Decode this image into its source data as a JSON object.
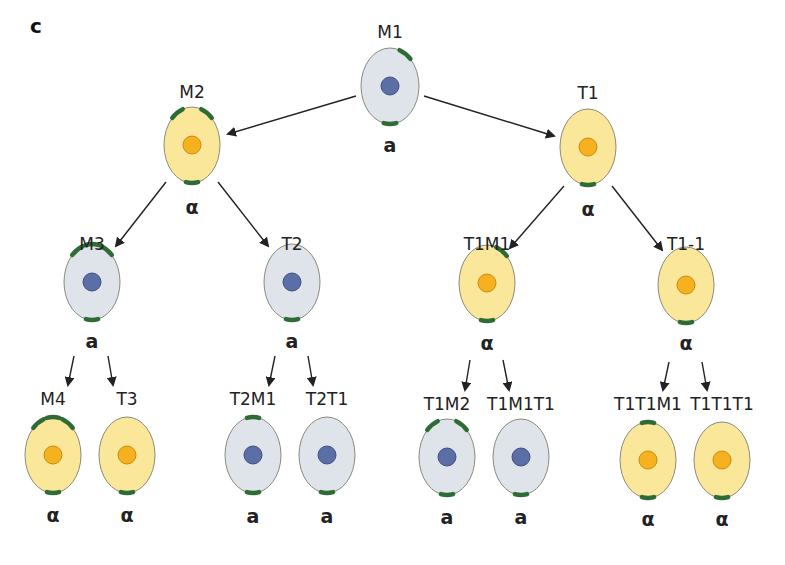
{
  "figure": {
    "panel_label": "c",
    "colors": {
      "a_cell_fill": "#dfe3ea",
      "a_nucleus": "#5b6ea6",
      "alpha_cell_fill": "#fbe79a",
      "alpha_nucleus": "#f6b21e",
      "cell_outline": "#8a8a7a",
      "polar_mark": "#2f6b34",
      "arrow": "#222222"
    },
    "cells": [
      {
        "id": "M1",
        "label": "M1",
        "fate": "a",
        "type": "a",
        "cx": 390,
        "cy": 86,
        "rx": 29,
        "ry": 38,
        "lx": 390,
        "ly": 38,
        "fy": 152,
        "marks": [
          "top-right",
          "bottom"
        ]
      },
      {
        "id": "M2",
        "label": "M2",
        "fate": "α",
        "type": "alpha",
        "cx": 192,
        "cy": 145,
        "rx": 28,
        "ry": 38,
        "lx": 192,
        "ly": 98,
        "fy": 214,
        "marks": [
          "top-left",
          "top-right",
          "bottom"
        ]
      },
      {
        "id": "T1",
        "label": "T1",
        "fate": "α",
        "type": "alpha",
        "cx": 588,
        "cy": 147,
        "rx": 28,
        "ry": 38,
        "lx": 588,
        "ly": 99,
        "fy": 216,
        "marks": [
          "bottom"
        ]
      },
      {
        "id": "M3",
        "label": "M3",
        "fate": "a",
        "type": "a",
        "cx": 92,
        "cy": 282,
        "rx": 28,
        "ry": 38,
        "lx": 92,
        "ly": 250,
        "fy": 348,
        "marks": [
          "top-left",
          "top",
          "top-right",
          "bottom"
        ]
      },
      {
        "id": "T2",
        "label": "T2",
        "fate": "a",
        "type": "a",
        "cx": 292,
        "cy": 282,
        "rx": 28,
        "ry": 38,
        "lx": 292,
        "ly": 250,
        "fy": 348,
        "marks": [
          "bottom"
        ]
      },
      {
        "id": "T1M1",
        "label": "T1M1",
        "fate": "α",
        "type": "alpha",
        "cx": 487,
        "cy": 283,
        "rx": 28,
        "ry": 38,
        "lx": 487,
        "ly": 250,
        "fy": 350,
        "marks": [
          "top-right",
          "bottom"
        ]
      },
      {
        "id": "T1-1",
        "label": "T1-1",
        "fate": "α",
        "type": "alpha",
        "cx": 686,
        "cy": 285,
        "rx": 28,
        "ry": 38,
        "lx": 686,
        "ly": 250,
        "fy": 350,
        "marks": [
          "bottom"
        ]
      },
      {
        "id": "M4",
        "label": "M4",
        "fate": "α",
        "type": "alpha",
        "cx": 53,
        "cy": 455,
        "rx": 28,
        "ry": 38,
        "lx": 53,
        "ly": 405,
        "fy": 522,
        "marks": [
          "top-left",
          "top",
          "top-right",
          "bottom"
        ]
      },
      {
        "id": "T3",
        "label": "T3",
        "fate": "α",
        "type": "alpha",
        "cx": 127,
        "cy": 455,
        "rx": 28,
        "ry": 38,
        "lx": 127,
        "ly": 405,
        "fy": 522,
        "marks": [
          "bottom"
        ]
      },
      {
        "id": "T2M1",
        "label": "T2M1",
        "fate": "a",
        "type": "a",
        "cx": 253,
        "cy": 455,
        "rx": 28,
        "ry": 38,
        "lx": 253,
        "ly": 405,
        "fy": 523,
        "marks": [
          "top",
          "bottom"
        ]
      },
      {
        "id": "T2T1",
        "label": "T2T1",
        "fate": "a",
        "type": "a",
        "cx": 327,
        "cy": 455,
        "rx": 28,
        "ry": 38,
        "lx": 327,
        "ly": 405,
        "fy": 523,
        "marks": [
          "bottom"
        ]
      },
      {
        "id": "T1M2",
        "label": "T1M2",
        "fate": "a",
        "type": "a",
        "cx": 447,
        "cy": 457,
        "rx": 28,
        "ry": 38,
        "lx": 447,
        "ly": 410,
        "fy": 524,
        "marks": [
          "top-left",
          "top-right",
          "bottom"
        ]
      },
      {
        "id": "T1M1T1",
        "label": "T1M1T1",
        "fate": "a",
        "type": "a",
        "cx": 521,
        "cy": 457,
        "rx": 28,
        "ry": 38,
        "lx": 521,
        "ly": 410,
        "fy": 524,
        "marks": [
          "bottom"
        ]
      },
      {
        "id": "T1T1M1",
        "label": "T1T1M1",
        "fate": "α",
        "type": "alpha",
        "cx": 648,
        "cy": 460,
        "rx": 28,
        "ry": 38,
        "lx": 648,
        "ly": 410,
        "fy": 526,
        "marks": [
          "top",
          "bottom"
        ]
      },
      {
        "id": "T1T1T1",
        "label": "T1T1T1",
        "fate": "α",
        "type": "alpha",
        "cx": 722,
        "cy": 460,
        "rx": 28,
        "ry": 38,
        "lx": 722,
        "ly": 410,
        "fy": 526,
        "marks": [
          "bottom"
        ]
      }
    ],
    "arrows": [
      {
        "from": "M1",
        "to": "M2",
        "x1": 356,
        "y1": 96,
        "x2": 228,
        "y2": 134
      },
      {
        "from": "M1",
        "to": "T1",
        "x1": 424,
        "y1": 96,
        "x2": 554,
        "y2": 136
      },
      {
        "from": "M2",
        "to": "M3",
        "x1": 166,
        "y1": 182,
        "x2": 116,
        "y2": 246
      },
      {
        "from": "M2",
        "to": "T2",
        "x1": 218,
        "y1": 182,
        "x2": 268,
        "y2": 246
      },
      {
        "from": "T1",
        "to": "T1M1",
        "x1": 564,
        "y1": 186,
        "x2": 510,
        "y2": 248
      },
      {
        "from": "T1",
        "to": "T1-1",
        "x1": 612,
        "y1": 186,
        "x2": 662,
        "y2": 250
      },
      {
        "from": "M3",
        "to": "M4",
        "x1": 74,
        "y1": 356,
        "x2": 68,
        "y2": 385
      },
      {
        "from": "M3",
        "to": "T3",
        "x1": 108,
        "y1": 356,
        "x2": 113,
        "y2": 385
      },
      {
        "from": "T2",
        "to": "T2M1",
        "x1": 275,
        "y1": 356,
        "x2": 269,
        "y2": 385
      },
      {
        "from": "T2",
        "to": "T2T1",
        "x1": 308,
        "y1": 356,
        "x2": 313,
        "y2": 385
      },
      {
        "from": "T1M1",
        "to": "T1M2",
        "x1": 470,
        "y1": 360,
        "x2": 465,
        "y2": 390
      },
      {
        "from": "T1M1",
        "to": "T1M1T1",
        "x1": 503,
        "y1": 360,
        "x2": 509,
        "y2": 390
      },
      {
        "from": "T1-1",
        "to": "T1T1M1",
        "x1": 669,
        "y1": 362,
        "x2": 663,
        "y2": 390
      },
      {
        "from": "T1-1",
        "to": "T1T1T1",
        "x1": 702,
        "y1": 362,
        "x2": 707,
        "y2": 390
      }
    ]
  }
}
